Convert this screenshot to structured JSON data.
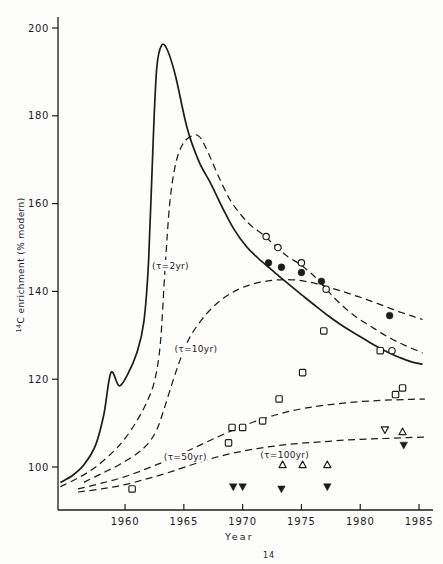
{
  "figure": {
    "caption_sup": "14"
  },
  "chart_data": {
    "type": "line",
    "title": "",
    "xlabel": "Year",
    "ylabel_sup": "14",
    "ylabel_text": "C enrichment (% modern)",
    "xlim": [
      1954.3,
      1986.3
    ],
    "ylim": [
      90,
      202.5
    ],
    "x_ticks": [
      1960,
      1965,
      1970,
      1975,
      1980,
      1985
    ],
    "y_ticks": [
      100,
      120,
      140,
      160,
      180,
      200
    ],
    "grid": false,
    "legend": "none",
    "ink_color": "#1c1c1c",
    "curves": [
      {
        "name": "atmosphere",
        "style": "solid",
        "points": [
          [
            1954.5,
            96.5
          ],
          [
            1955.5,
            98
          ],
          [
            1956.5,
            100.5
          ],
          [
            1957.5,
            105
          ],
          [
            1958.2,
            112
          ],
          [
            1958.8,
            121.5
          ],
          [
            1959.5,
            118.5
          ],
          [
            1960.2,
            121
          ],
          [
            1961,
            126
          ],
          [
            1961.6,
            133
          ],
          [
            1962,
            147
          ],
          [
            1962.4,
            175
          ],
          [
            1962.7,
            191
          ],
          [
            1963.1,
            196
          ],
          [
            1963.6,
            195
          ],
          [
            1964.3,
            189
          ],
          [
            1965.3,
            177
          ],
          [
            1966.3,
            169.5
          ],
          [
            1967.3,
            164.5
          ],
          [
            1968.3,
            159
          ],
          [
            1969.3,
            154
          ],
          [
            1970.3,
            150.3
          ],
          [
            1971.3,
            147.6
          ],
          [
            1972.3,
            145.3
          ],
          [
            1973.3,
            143
          ],
          [
            1974.3,
            140.8
          ],
          [
            1975.3,
            138.6
          ],
          [
            1976.3,
            136.5
          ],
          [
            1977.3,
            134.4
          ],
          [
            1978.3,
            132.5
          ],
          [
            1979.3,
            130.8
          ],
          [
            1980.3,
            129.2
          ],
          [
            1981.3,
            127.6
          ],
          [
            1982.3,
            126.2
          ],
          [
            1983.3,
            125
          ],
          [
            1984.3,
            124
          ],
          [
            1985.3,
            123.4
          ]
        ]
      },
      {
        "name": "tau-2yr",
        "style": "dashed",
        "points": [
          [
            1954.5,
            95.5
          ],
          [
            1956,
            97.5
          ],
          [
            1957.5,
            100
          ],
          [
            1959,
            103.5
          ],
          [
            1960,
            106.5
          ],
          [
            1961,
            110.5
          ],
          [
            1961.8,
            114.5
          ],
          [
            1962.5,
            119.5
          ],
          [
            1963,
            128
          ],
          [
            1963.4,
            145
          ],
          [
            1963.8,
            160
          ],
          [
            1964.3,
            169
          ],
          [
            1964.9,
            173.5
          ],
          [
            1965.6,
            175.3
          ],
          [
            1966.3,
            175.3
          ],
          [
            1967,
            172
          ],
          [
            1967.9,
            166.5
          ],
          [
            1968.9,
            161
          ],
          [
            1969.9,
            157.3
          ],
          [
            1970.8,
            154.8
          ],
          [
            1971.8,
            152.8
          ],
          [
            1972.8,
            150.3
          ],
          [
            1973.8,
            148
          ],
          [
            1974.8,
            146.3
          ],
          [
            1975.8,
            144.2
          ],
          [
            1976.8,
            141.5
          ],
          [
            1977.8,
            138.5
          ],
          [
            1978.8,
            136
          ],
          [
            1979.8,
            133.9
          ],
          [
            1980.8,
            132.2
          ],
          [
            1981.8,
            130.5
          ],
          [
            1982.8,
            129
          ],
          [
            1983.8,
            127.7
          ],
          [
            1985.3,
            126
          ]
        ]
      },
      {
        "name": "tau-10yr",
        "style": "dashed",
        "points": [
          [
            1956.5,
            96.5
          ],
          [
            1958,
            98.5
          ],
          [
            1959.5,
            100.5
          ],
          [
            1961,
            103
          ],
          [
            1962,
            105.5
          ],
          [
            1962.7,
            108.5
          ],
          [
            1963.3,
            113
          ],
          [
            1964,
            119
          ],
          [
            1964.7,
            124.5
          ],
          [
            1965.5,
            129.5
          ],
          [
            1966.5,
            133.5
          ],
          [
            1967.5,
            136.5
          ],
          [
            1968.5,
            138.7
          ],
          [
            1969.5,
            140.3
          ],
          [
            1970.5,
            141.4
          ],
          [
            1971.5,
            142.1
          ],
          [
            1972.5,
            142.5
          ],
          [
            1973.5,
            142.7
          ],
          [
            1974.5,
            142.6
          ],
          [
            1975.5,
            142.2
          ],
          [
            1976.5,
            141.6
          ],
          [
            1977.5,
            140.8
          ],
          [
            1978.5,
            140
          ],
          [
            1979.5,
            139.1
          ],
          [
            1980.5,
            138.2
          ],
          [
            1981.5,
            137.2
          ],
          [
            1982.5,
            136.2
          ],
          [
            1983.5,
            135.2
          ],
          [
            1984.5,
            134.3
          ],
          [
            1985.3,
            133.6
          ]
        ]
      },
      {
        "name": "tau-50yr",
        "style": "dashed",
        "points": [
          [
            1956,
            95
          ],
          [
            1958,
            96.3
          ],
          [
            1960,
            97.8
          ],
          [
            1962,
            99.8
          ],
          [
            1964,
            102
          ],
          [
            1966,
            104.5
          ],
          [
            1968,
            107
          ],
          [
            1970,
            109.3
          ],
          [
            1972,
            111.2
          ],
          [
            1974,
            112.7
          ],
          [
            1976,
            113.7
          ],
          [
            1978,
            114.4
          ],
          [
            1980,
            114.9
          ],
          [
            1982,
            115.2
          ],
          [
            1984,
            115.4
          ],
          [
            1985.5,
            115.5
          ]
        ]
      },
      {
        "name": "tau-100yr",
        "style": "dashed",
        "points": [
          [
            1956,
            94.3
          ],
          [
            1958,
            95
          ],
          [
            1960,
            96
          ],
          [
            1962,
            97.4
          ],
          [
            1964,
            99
          ],
          [
            1966,
            100.8
          ],
          [
            1968,
            102.4
          ],
          [
            1970,
            103.6
          ],
          [
            1972,
            104.5
          ],
          [
            1974,
            105.2
          ],
          [
            1976,
            105.6
          ],
          [
            1978,
            106
          ],
          [
            1980,
            106.3
          ],
          [
            1982,
            106.5
          ],
          [
            1984,
            106.7
          ],
          [
            1985.7,
            106.8
          ]
        ]
      }
    ],
    "curve_labels": [
      {
        "for": "tau-2yr",
        "text": "(τ=2yr)",
        "year": 1962.3,
        "value": 145.8
      },
      {
        "for": "tau-10yr",
        "text": "(τ=10yr)",
        "year": 1964.2,
        "value": 126.9
      },
      {
        "for": "tau-50yr",
        "text": "(τ=50yr)",
        "year": 1963.3,
        "value": 102.3
      },
      {
        "for": "tau-100yr",
        "text": "(τ=100yr)",
        "year": 1971.5,
        "value": 102.7
      }
    ],
    "series": [
      {
        "name": "open-circles",
        "marker": "circle-open",
        "points": [
          [
            1972,
            152.5
          ],
          [
            1973,
            150
          ],
          [
            1975,
            146.5
          ],
          [
            1977.1,
            140.5
          ],
          [
            1982.7,
            126.5
          ]
        ]
      },
      {
        "name": "filled-circles",
        "marker": "circle-filled",
        "points": [
          [
            1972.2,
            146.5
          ],
          [
            1973.3,
            145.5
          ],
          [
            1975,
            144.3
          ],
          [
            1976.7,
            142.3
          ],
          [
            1982.5,
            134.5
          ]
        ]
      },
      {
        "name": "open-squares",
        "marker": "square-open",
        "points": [
          [
            1960.6,
            95
          ],
          [
            1968.8,
            105.5
          ],
          [
            1969.1,
            109
          ],
          [
            1970,
            109
          ],
          [
            1971.7,
            110.5
          ],
          [
            1973.1,
            115.5
          ],
          [
            1975.1,
            121.5
          ],
          [
            1976.9,
            131
          ],
          [
            1981.7,
            126.5
          ],
          [
            1983,
            116.5
          ],
          [
            1983.6,
            118
          ]
        ]
      },
      {
        "name": "open-triangles-up",
        "marker": "triangle-up-open",
        "points": [
          [
            1973.4,
            100.5
          ],
          [
            1975.1,
            100.5
          ],
          [
            1977.2,
            100.5
          ],
          [
            1983.6,
            108
          ]
        ]
      },
      {
        "name": "open-triangles-down",
        "marker": "triangle-down-open",
        "points": [
          [
            1982.1,
            108.5
          ]
        ]
      },
      {
        "name": "filled-triangles-down",
        "marker": "triangle-down-filled",
        "points": [
          [
            1969.2,
            95.5
          ],
          [
            1970,
            95.5
          ],
          [
            1973.3,
            95
          ],
          [
            1977.2,
            95.5
          ],
          [
            1983.7,
            105
          ]
        ]
      }
    ]
  }
}
